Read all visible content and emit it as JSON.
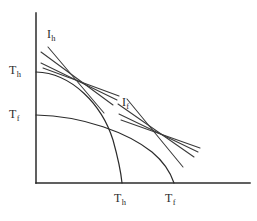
{
  "figure": {
    "title": "",
    "background_color": "#ffffff",
    "stroke_color": "#2b2b2b",
    "width": 257,
    "height": 221
  },
  "axes": {
    "origin": {
      "x": 36,
      "y": 183
    },
    "y_axis": {
      "x": 36,
      "y_top": 13,
      "y_bottom": 183
    },
    "x_axis": {
      "y": 183,
      "x_left": 36,
      "x_right": 250
    }
  },
  "labels": {
    "y_axis_upper": {
      "symbol": "T",
      "subscript": "h",
      "text": "Th",
      "x": 9,
      "y": 64
    },
    "y_axis_lower": {
      "symbol": "T",
      "subscript": "f",
      "text": "Tf",
      "x": 9,
      "y": 108
    },
    "x_axis_left": {
      "symbol": "T",
      "subscript": "h",
      "text": "Th",
      "x": 114,
      "y": 192
    },
    "x_axis_right": {
      "symbol": "T",
      "subscript": "f",
      "text": "Tf",
      "x": 165,
      "y": 192
    },
    "curve_upper": {
      "symbol": "I",
      "subscript": "h",
      "text": "Ih",
      "x": 47,
      "y": 28
    },
    "curve_lower": {
      "symbol": "I",
      "subscript": "f",
      "text": "If",
      "x": 122,
      "y": 96
    }
  },
  "chart_data": {
    "type": "line",
    "title": "",
    "xlabel": "",
    "ylabel": "",
    "grid": false,
    "legend": "none",
    "curves": [
      {
        "name": "isotherm-Th",
        "label": "Th",
        "y_intercept": {
          "x": 36,
          "y": 72
        },
        "x_intercept": {
          "x": 122,
          "y": 183
        },
        "path": "M 36 72 C 72 73 102 105 113 140 C 118 158 121 173 122 183",
        "tangency_point": {
          "x": 75,
          "y": 85
        }
      },
      {
        "name": "isotherm-Tf",
        "label": "Tf",
        "y_intercept": {
          "x": 36,
          "y": 115
        },
        "x_intercept": {
          "x": 174,
          "y": 183
        },
        "path": "M 36 115 C 84 116 128 133 152 152 C 164 162 171 174 174 183",
        "tangency_point": {
          "x": 152,
          "y": 135
        }
      }
    ],
    "tangent_fans": [
      {
        "name": "fan-Ih",
        "label": "Ih",
        "focus": {
          "x": 75,
          "y": 85
        },
        "lines": [
          {
            "x1": 41,
            "y1": 52,
            "x2": 113,
            "y2": 105
          },
          {
            "x1": 41,
            "y1": 63,
            "x2": 117,
            "y2": 100
          },
          {
            "x1": 43,
            "y1": 68,
            "x2": 119,
            "y2": 96
          },
          {
            "x1": 48,
            "y1": 47,
            "x2": 104,
            "y2": 113
          }
        ]
      },
      {
        "name": "fan-If",
        "label": "If",
        "focus": {
          "x": 152,
          "y": 135
        },
        "lines": [
          {
            "x1": 118,
            "y1": 104,
            "x2": 194,
            "y2": 157
          },
          {
            "x1": 119,
            "y1": 114,
            "x2": 198,
            "y2": 152
          },
          {
            "x1": 121,
            "y1": 120,
            "x2": 200,
            "y2": 148
          },
          {
            "x1": 127,
            "y1": 99,
            "x2": 183,
            "y2": 167
          }
        ]
      }
    ],
    "axis_ticks": {
      "x": [
        {
          "label": "Th",
          "x": 122
        },
        {
          "label": "Tf",
          "x": 174
        }
      ],
      "y": [
        {
          "label": "Th",
          "y": 72
        },
        {
          "label": "Tf",
          "y": 115
        }
      ]
    }
  }
}
